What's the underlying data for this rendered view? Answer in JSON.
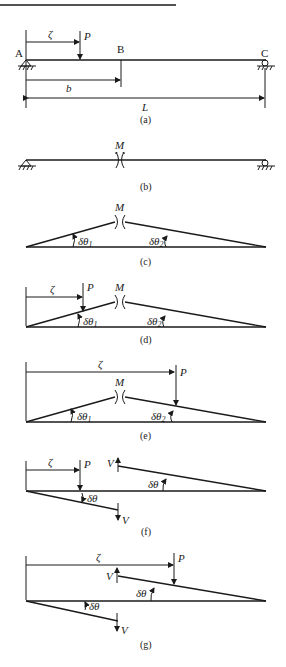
{
  "figure": {
    "panels": [
      {
        "id": "a",
        "caption": "(a)",
        "labels": {
          "A": "A",
          "B": "B",
          "C": "C",
          "P": "P",
          "zeta": "ζ",
          "b": "b",
          "L": "L"
        }
      },
      {
        "id": "b",
        "caption": "(b)",
        "labels": {
          "M": "M"
        }
      },
      {
        "id": "c",
        "caption": "(c)",
        "labels": {
          "M": "M",
          "dtheta1": "δθ",
          "sub1": "1",
          "dtheta2": "δθ",
          "sub2": "2"
        }
      },
      {
        "id": "d",
        "caption": "(d)",
        "labels": {
          "M": "M",
          "P": "P",
          "zeta": "ζ",
          "dtheta1": "δθ",
          "sub1": "1",
          "dtheta2": "δθ",
          "sub2": "2"
        }
      },
      {
        "id": "e",
        "caption": "(e)",
        "labels": {
          "M": "M",
          "P": "P",
          "zeta": "ζ",
          "dtheta1": "δθ",
          "sub1": "1",
          "dtheta2": "δθ",
          "sub2": "2"
        }
      },
      {
        "id": "f",
        "caption": "(f)",
        "labels": {
          "P": "P",
          "zeta": "ζ",
          "V_top": "V",
          "V_bottom": "V",
          "dtheta_top": "δθ",
          "dtheta_bottom": "δθ"
        }
      },
      {
        "id": "g",
        "caption": "(g)",
        "labels": {
          "P": "P",
          "zeta": "ζ",
          "V_top": "V",
          "V_bottom": "V",
          "dtheta_top": "δθ",
          "dtheta_bottom": "δθ"
        }
      }
    ]
  }
}
